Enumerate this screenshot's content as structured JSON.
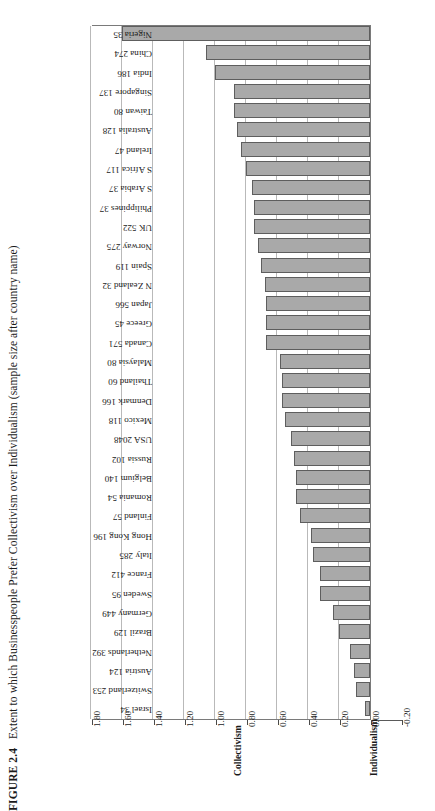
{
  "figure": {
    "label": "FIGURE 2.4",
    "caption": "Extent to which Businesspeople Prefer Collectivism over Individualism (sample size after country name)"
  },
  "axis": {
    "low_pole_label": "Individualism",
    "high_pole_label": "Collectivism",
    "ticks": [
      "1.80",
      "1.60",
      "1.40",
      "1.20",
      "1.00",
      "0.80",
      "0.60",
      "0.40",
      "0.20",
      "0.00",
      "-0.20"
    ]
  },
  "style": {
    "bar_fill": "#a9a9a9",
    "bar_stroke": "#5e5e5e",
    "gridline": "#b9b9b9",
    "frame": "#7a7a7a"
  },
  "chart_data": {
    "type": "bar",
    "orientation": "horizontal",
    "title": "Extent to which Businesspeople Prefer Collectivism over Individualism (sample size after country name)",
    "xlabel": "",
    "ylabel": "",
    "xlim": [
      -0.2,
      1.8
    ],
    "grid": true,
    "legend": null,
    "axis_pole_low": "Individualism",
    "axis_pole_high": "Collectivism",
    "tick_labels": [
      "1.80",
      "1.60",
      "1.40",
      "1.20",
      "1.00",
      "0.80",
      "0.60",
      "0.40",
      "0.20",
      "0.00",
      "-0.20"
    ],
    "categories": [
      "Israel 34",
      "Switzerland 253",
      "Austria 124",
      "Netherlands 392",
      "Brazil 129",
      "Germany 449",
      "Sweden 95",
      "France 412",
      "Italy 285",
      "Hong Kong 196",
      "Finland 57",
      "Romania 54",
      "Belgium 140",
      "Russia 102",
      "USA 2048",
      "Mexico 118",
      "Denmark 166",
      "Thailand 60",
      "Malaysia 80",
      "Canada 571",
      "Greece 45",
      "Japan 566",
      "N Zealand 32",
      "Spain 119",
      "Norway 275",
      "UK 522",
      "Philippines 37",
      "S Arabia 37",
      "S Africa 117",
      "Ireland 47",
      "Australia 128",
      "Taiwan 80",
      "Singapore 137",
      "India 186",
      "China 274",
      "Nigeria 35"
    ],
    "countries": [
      "Israel",
      "Switzerland",
      "Austria",
      "Netherlands",
      "Brazil",
      "Germany",
      "Sweden",
      "France",
      "Italy",
      "Hong Kong",
      "Finland",
      "Romania",
      "Belgium",
      "Russia",
      "USA",
      "Mexico",
      "Denmark",
      "Thailand",
      "Malaysia",
      "Canada",
      "Greece",
      "Japan",
      "N Zealand",
      "Spain",
      "Norway",
      "UK",
      "Philippines",
      "S Arabia",
      "S Africa",
      "Ireland",
      "Australia",
      "Taiwan",
      "Singapore",
      "India",
      "China",
      "Nigeria"
    ],
    "sample_sizes": [
      34,
      253,
      124,
      392,
      129,
      449,
      95,
      412,
      285,
      196,
      57,
      54,
      140,
      102,
      2048,
      118,
      166,
      60,
      80,
      571,
      45,
      566,
      32,
      119,
      275,
      522,
      37,
      37,
      117,
      47,
      128,
      80,
      137,
      186,
      274,
      35
    ],
    "values": [
      0.03,
      0.09,
      0.1,
      0.13,
      0.2,
      0.24,
      0.32,
      0.32,
      0.37,
      0.38,
      0.45,
      0.48,
      0.48,
      0.49,
      0.51,
      0.55,
      0.57,
      0.57,
      0.58,
      0.67,
      0.67,
      0.67,
      0.68,
      0.7,
      0.72,
      0.75,
      0.75,
      0.76,
      0.8,
      0.83,
      0.86,
      0.88,
      0.88,
      1.0,
      1.06,
      1.6
    ]
  }
}
